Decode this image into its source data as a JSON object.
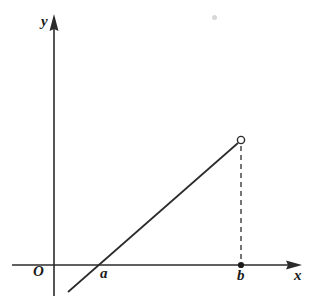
{
  "figure": {
    "kind": "cartesian-coordinate-line-graph",
    "background_color": "#ffffff",
    "stroke_color": "#2b2b2b",
    "axes": {
      "y_axis_label": "y",
      "x_axis_label": "x",
      "origin_label": "O",
      "y_axis_x_px": 54,
      "y_axis_top_px": 15,
      "y_axis_bottom_px": 296,
      "x_axis_y_px": 265,
      "x_axis_left_px": 12,
      "x_axis_right_px": 302
    },
    "tick_labels": [
      {
        "name": "a",
        "text": "a",
        "x_px": 98,
        "marker": "none"
      },
      {
        "name": "b",
        "text": "b",
        "x_px": 241,
        "marker": "filled-dot"
      }
    ],
    "line_segment": {
      "name": "linear-function-segment",
      "style": "solid",
      "x_start_px": 68,
      "y_start_px": 292,
      "x_end_px": 241,
      "y_end_px": 140,
      "x_intercept_label": "a",
      "endpoint_marker": "open-circle",
      "endpoint_meaning": "excluded endpoint at x = b"
    },
    "dashed_drop_line": {
      "name": "drop-line-to-b",
      "style": "dashed",
      "x_px": 241,
      "y_top_px": 142,
      "y_bottom_px": 263
    },
    "artifact_speck": {
      "x_px": 212,
      "y_px": 15
    }
  },
  "chart_data": {
    "type": "line",
    "title": "",
    "xlabel": "x",
    "ylabel": "y",
    "grid": false,
    "legend": null,
    "annotations": [
      "O",
      "a",
      "b"
    ],
    "x": [
      "a",
      "b"
    ],
    "series": [
      {
        "name": "f(x)",
        "description": "Increasing straight line crossing the x-axis at a, drawn from below the axis up to an open (excluded) endpoint above b",
        "points": [
          {
            "x_label": "",
            "x_px": 68,
            "y_px": 292
          },
          {
            "x_label": "a",
            "x_px": 98,
            "y_px": 265
          },
          {
            "x_label": "b",
            "x_px": 241,
            "y_px": 140
          }
        ],
        "endpoint_open_at": "b"
      }
    ]
  }
}
